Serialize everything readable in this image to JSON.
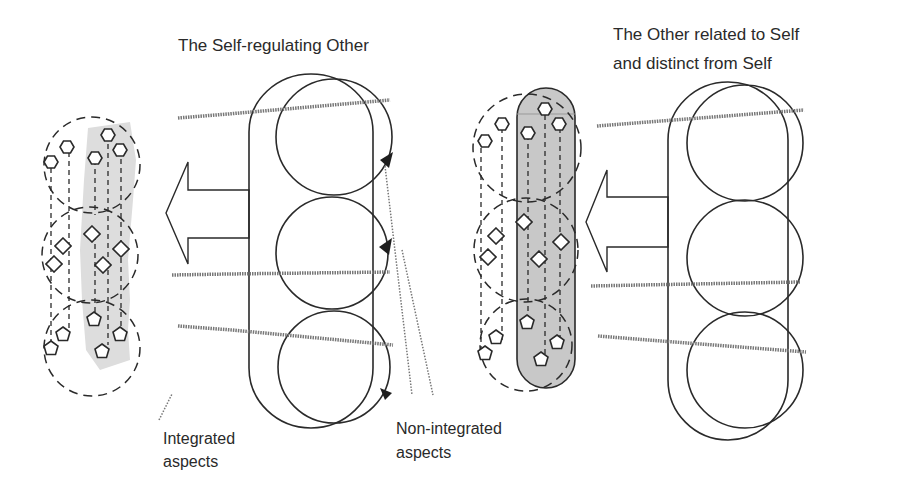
{
  "titles": {
    "self_regulating_other": "The Self-regulating Other",
    "other_related_line1": "The Other related to Self",
    "other_related_line2": "and distinct from Self"
  },
  "labels": {
    "integrated_line1": "Integrated",
    "integrated_line2": "aspects",
    "non_integrated_line1": "Non-integrated",
    "non_integrated_line2": "aspects"
  },
  "colors": {
    "stroke": "#2a2a2a",
    "grey_fill": "#c8c8c8",
    "light_grey_fill": "#e2e2e2",
    "background": "#ffffff"
  },
  "groups": [
    {
      "id": "left-dashed-group",
      "shapes": [
        "pentagon",
        "pentagon",
        "pentagon",
        "pentagon",
        "diamond",
        "diamond",
        "diamond",
        "diamond",
        "diamond",
        "pentagon",
        "pentagon",
        "pentagon",
        "pentagon"
      ]
    },
    {
      "id": "self-regulating-capsule",
      "circles": 3
    },
    {
      "id": "middle-dashed-group",
      "shapes": [
        "hexagon",
        "hexagon",
        "hexagon",
        "hexagon",
        "hexagon",
        "diamond",
        "diamond",
        "diamond",
        "diamond",
        "diamond",
        "pentagon",
        "pentagon",
        "pentagon",
        "pentagon",
        "pentagon"
      ]
    },
    {
      "id": "other-related-capsule",
      "circles": 3
    }
  ]
}
